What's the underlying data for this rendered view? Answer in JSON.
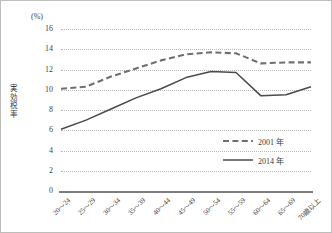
{
  "chart_data": {
    "type": "line",
    "title": "",
    "xlabel": "",
    "ylabel": "実効税率",
    "unit_label": "(%)",
    "ylim": [
      0,
      16
    ],
    "ytick_step": 2,
    "yticks": [
      "16",
      "14",
      "12",
      "10",
      "8",
      "6",
      "4",
      "2",
      "0"
    ],
    "grid": true,
    "legend_position": "inside-right",
    "categories": [
      "20～24",
      "25～29",
      "30～34",
      "35～39",
      "40～44",
      "45～49",
      "50～54",
      "55～59",
      "60～64",
      "65～69",
      "70歳以上"
    ],
    "series": [
      {
        "name": "2001 年",
        "style": "dashed",
        "color": "#6f6f6f",
        "values": [
          10.1,
          10.3,
          11.3,
          12.1,
          12.9,
          13.5,
          13.7,
          13.6,
          12.6,
          12.7,
          12.7
        ]
      },
      {
        "name": "2014 年",
        "style": "solid",
        "color": "#4a4a4a",
        "values": [
          6.1,
          7.0,
          8.1,
          9.2,
          10.1,
          11.2,
          11.8,
          11.7,
          9.4,
          9.5,
          10.3
        ]
      }
    ]
  },
  "legend": [
    {
      "label": "2001 年",
      "style": "dashed"
    },
    {
      "label": "2014 年",
      "style": "solid"
    }
  ],
  "colors": {
    "series_2001": "#6f6f6f",
    "series_2014": "#4a4a4a",
    "grid": "#b9b9b9",
    "axis": "#7d7d7d",
    "border": "#bdbdbd",
    "text": "#3a3a3a"
  }
}
